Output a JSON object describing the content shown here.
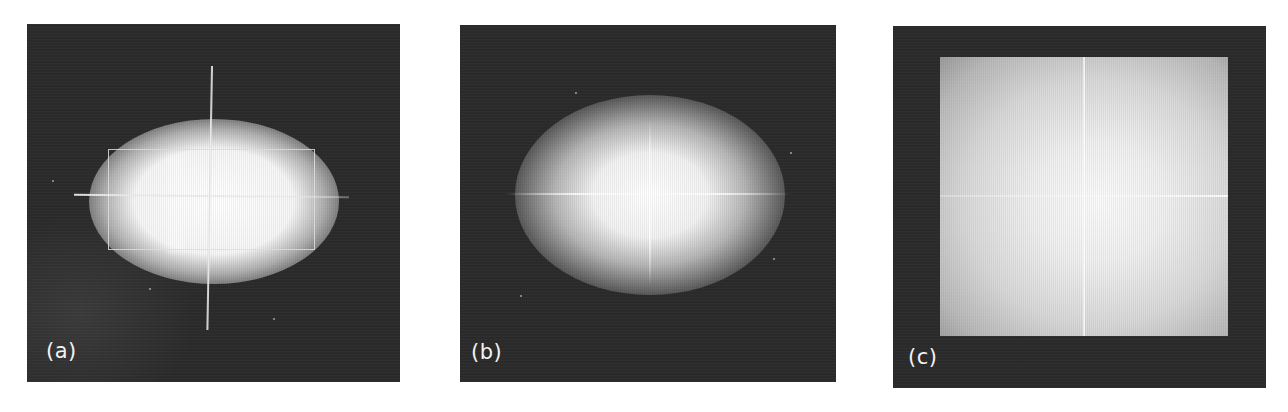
{
  "figure": {
    "panels": [
      {
        "id": "a",
        "label": "(a)",
        "description": "Bright elliptical glow on dark background with a cross-hair (vertical and horizontal lines) and a rectangular outline enclosing the glow"
      },
      {
        "id": "b",
        "label": "(b)",
        "description": "Soft elliptical glow on dark background with faint cross-hair lines through the center"
      },
      {
        "id": "c",
        "label": "(c)",
        "description": "Large bright square region with radial falloff inside a dark frame, divided by faint vertical and horizontal lines"
      }
    ]
  },
  "colors": {
    "page_background": "#ffffff",
    "panel_background": "#2b2b2b",
    "label_text": "#f2f2f2",
    "glow_center": "#ffffff"
  }
}
